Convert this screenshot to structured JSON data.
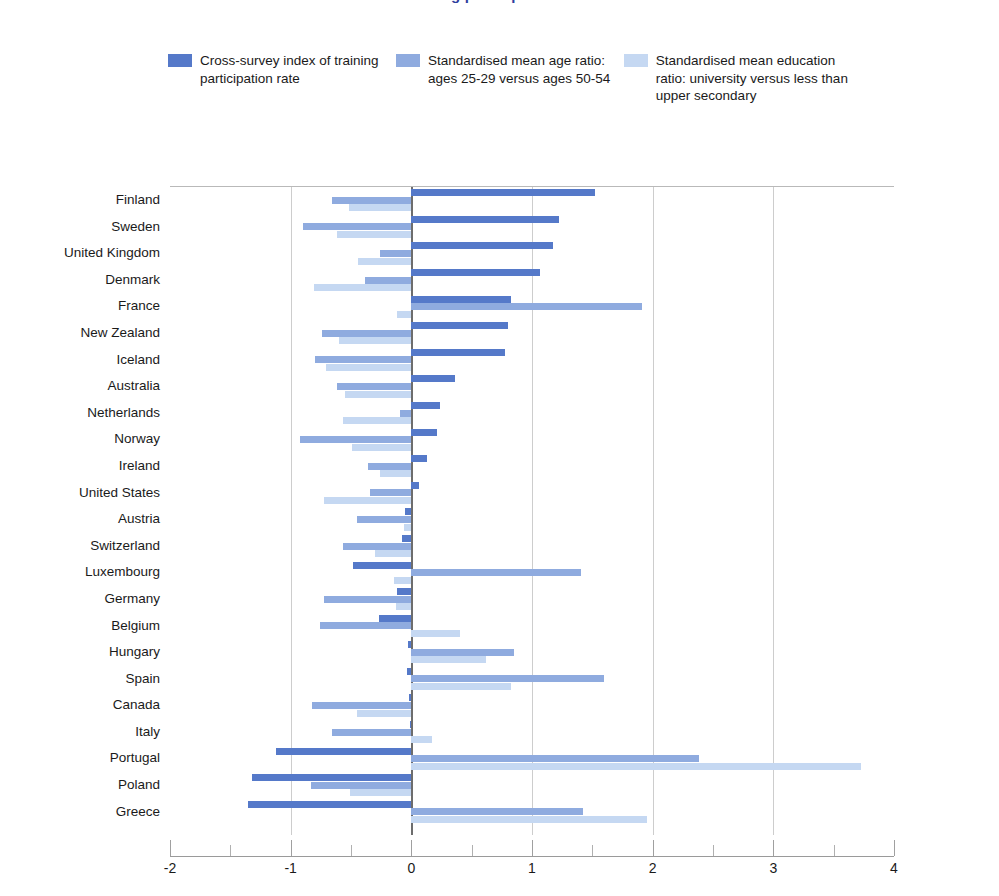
{
  "title": "Training participation rates",
  "legend": {
    "position": "top",
    "items": [
      {
        "label": "Cross-survey index of training participation rate",
        "color": "#5579c9",
        "swatch_name": "legend-swatch-series-1"
      },
      {
        "label": "Standardised mean age ratio: ages 25-29 versus ages 50-54",
        "color": "#8fabdf",
        "swatch_name": "legend-swatch-series-2"
      },
      {
        "label": "Standardised mean education ratio: university versus less than upper secondary",
        "color": "#c5d8f2",
        "swatch_name": "legend-swatch-series-3"
      }
    ]
  },
  "axis": {
    "xlabel": "",
    "ylabel": "",
    "xlim": [
      -2,
      4
    ],
    "xticks": [
      -2,
      -1,
      0,
      1,
      2,
      3,
      4
    ],
    "xtick_labels": [
      "-2",
      "-1",
      "0",
      "1",
      "2",
      "3",
      "4"
    ],
    "xminor": [
      -1.5,
      -0.5,
      0.5,
      1.5,
      2.5,
      3.5
    ],
    "grid": "vertical-major"
  },
  "colors": {
    "series1": "#5579c9",
    "series2": "#8fabdf",
    "series3": "#c5d8f2",
    "gridline": "#cdcdcd",
    "zeroline": "#6d6d6d",
    "axis": "#9a9a9a",
    "title": "#2f3e9e",
    "text": "#1a1a1a"
  },
  "chart_data": {
    "type": "bar",
    "orientation": "horizontal",
    "title": "Training participation rates",
    "xlabel": "",
    "ylabel": "",
    "xlim": [
      -2,
      4
    ],
    "grid": true,
    "legend_position": "top",
    "categories": [
      "Finland",
      "Sweden",
      "United Kingdom",
      "Denmark",
      "France",
      "New Zealand",
      "Iceland",
      "Australia",
      "Netherlands",
      "Norway",
      "Ireland",
      "United States",
      "Austria",
      "Switzerland",
      "Luxembourg",
      "Germany",
      "Belgium",
      "Hungary",
      "Spain",
      "Canada",
      "Italy",
      "Portugal",
      "Poland",
      "Greece"
    ],
    "series": [
      {
        "name": "Cross-survey index of training participation rate",
        "color": "#5579c9",
        "values": [
          1.52,
          1.22,
          1.17,
          1.07,
          0.83,
          0.8,
          0.78,
          0.36,
          0.24,
          0.21,
          0.13,
          0.06,
          -0.05,
          -0.08,
          -0.48,
          -0.12,
          -0.27,
          -0.03,
          -0.04,
          -0.02,
          -0.01,
          -1.12,
          -1.32,
          -1.35
        ]
      },
      {
        "name": "Standardised mean age ratio: ages 25-29 versus ages 50-54",
        "color": "#8fabdf",
        "values": [
          -0.66,
          -0.9,
          -0.26,
          -0.38,
          1.91,
          -0.74,
          -0.8,
          -0.62,
          -0.09,
          -0.92,
          -0.36,
          -0.34,
          -0.45,
          -0.57,
          1.41,
          -0.72,
          -0.76,
          0.85,
          1.6,
          -0.82,
          -0.66,
          2.38,
          -0.83,
          1.42
        ]
      },
      {
        "name": "Standardised mean education ratio: university versus less than upper secondary",
        "color": "#c5d8f2",
        "values": [
          -0.52,
          -0.62,
          -0.44,
          -0.81,
          -0.12,
          -0.6,
          -0.71,
          -0.55,
          -0.57,
          -0.49,
          -0.26,
          -0.72,
          -0.06,
          -0.3,
          -0.14,
          -0.13,
          0.4,
          0.62,
          0.83,
          -0.45,
          0.17,
          3.73,
          -0.51,
          1.95
        ]
      }
    ]
  }
}
